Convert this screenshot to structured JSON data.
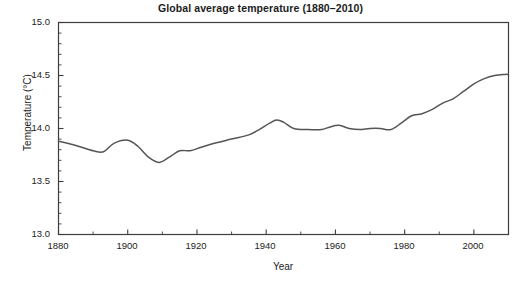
{
  "chart_data": {
    "type": "line",
    "title": "Global average temperature (1880–2010)",
    "xlabel": "Year",
    "ylabel": "Temperature (°C)",
    "xlim": [
      1880,
      2010
    ],
    "ylim": [
      13.0,
      15.0
    ],
    "grid": false,
    "legend": null,
    "line_color": "#555555",
    "xticks": [
      1880,
      1900,
      1920,
      1940,
      1960,
      1980,
      2000
    ],
    "xtick_labels": [
      "1880",
      "1900",
      "1920",
      "1940",
      "1960",
      "1980",
      "2000"
    ],
    "xminor_step": 10,
    "yticks": [
      13.0,
      13.5,
      14.0,
      14.5,
      15.0
    ],
    "ytick_labels": [
      "13.0",
      "13.5",
      "14.0",
      "14.5",
      "15.0"
    ],
    "yminor_step": 0.1,
    "series": [
      {
        "name": "Global average temperature",
        "x": [
          1880,
          1885,
          1890,
          1893,
          1896,
          1900,
          1903,
          1906,
          1909,
          1912,
          1915,
          1918,
          1921,
          1925,
          1930,
          1935,
          1938,
          1941,
          1943,
          1945,
          1948,
          1952,
          1956,
          1958,
          1961,
          1964,
          1967,
          1970,
          1973,
          1976,
          1979,
          1982,
          1985,
          1988,
          1991,
          1994,
          1997,
          2000,
          2003,
          2006,
          2009,
          2010
        ],
        "y": [
          13.88,
          13.84,
          13.79,
          13.78,
          13.86,
          13.89,
          13.83,
          13.73,
          13.68,
          13.73,
          13.79,
          13.79,
          13.82,
          13.86,
          13.9,
          13.94,
          13.99,
          14.05,
          14.08,
          14.06,
          14.0,
          13.99,
          13.99,
          14.01,
          14.03,
          14.0,
          13.99,
          14.0,
          14.0,
          13.99,
          14.05,
          14.12,
          14.14,
          14.18,
          14.24,
          14.28,
          14.35,
          14.42,
          14.47,
          14.5,
          14.51,
          14.51
        ]
      }
    ]
  },
  "axes": {
    "frame_color": "#3d3d3d"
  }
}
